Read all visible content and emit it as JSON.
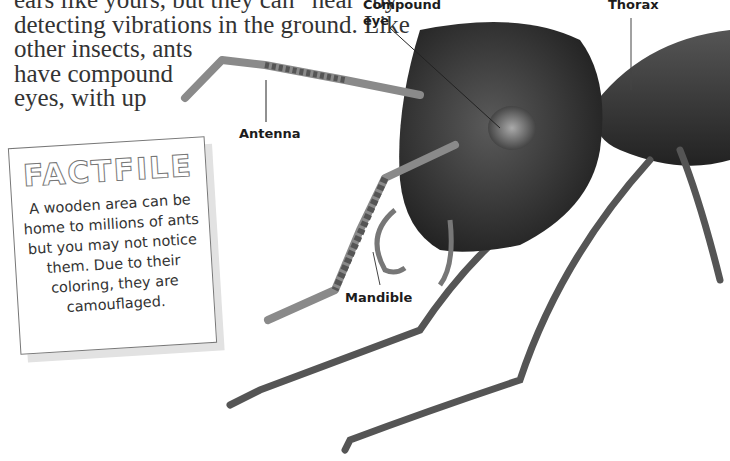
{
  "page": {
    "body_text_lines": [
      "ears like yours, but they can “hear” by",
      "detecting vibrations in the ground. Like",
      "other insects, ants",
      "have compound",
      "eyes, with up"
    ]
  },
  "labels": {
    "compound_eye_line1": "Compound",
    "compound_eye_line2": "eye",
    "thorax": "Thorax",
    "antenna": "Antenna",
    "mandible": "Mandible"
  },
  "factfile": {
    "title": "FACTFILE",
    "lines": [
      "A wooden area can be",
      "home to millions of ants",
      "but you may not notice",
      "them. Due to their",
      "coloring, they are",
      "camouflaged."
    ]
  },
  "illustration": {
    "subject": "ant-head-and-thorax",
    "colors": {
      "body": "#3a3a3a",
      "leg": "#555555",
      "antenna": "#8a8a8a",
      "eye": "#9a9a9a"
    }
  }
}
